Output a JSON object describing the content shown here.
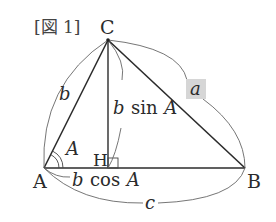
{
  "figure": {
    "title": "[図 1]",
    "vertices": {
      "A": {
        "label": "A",
        "x": 44,
        "y": 168
      },
      "B": {
        "label": "B",
        "x": 245,
        "y": 168
      },
      "C": {
        "label": "C",
        "x": 108,
        "y": 40
      },
      "H": {
        "label": "H",
        "x": 108,
        "y": 168
      }
    },
    "labels": {
      "side_a": "a",
      "side_b": "b",
      "side_c": "c",
      "angle_A": "A",
      "height": "b sin A",
      "height_b": "b",
      "height_sin": "sin",
      "height_A": "A",
      "foot": "b cos A",
      "foot_b": "b",
      "foot_cos": "cos",
      "foot_A": "A"
    },
    "colors": {
      "line": "#2b2b2b",
      "arc": "#555555",
      "highlight": "#d6d6d6"
    }
  }
}
